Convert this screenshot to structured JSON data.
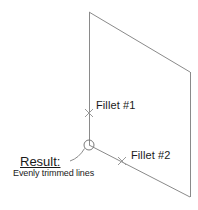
{
  "diagram": {
    "stroke_color": "#8a8a8a",
    "marker_color": "#8a8a8a",
    "text_color": "#1a1a1a",
    "background": "#ffffff",
    "annotations": {
      "fillet_1": "Fillet #1",
      "fillet_2": "Fillet #2",
      "result_title": "Result:",
      "result_description": "Evenly trimmed lines"
    },
    "geometry": {
      "shape": "parallelogram",
      "vertices": [
        {
          "name": "top-left",
          "x": 89,
          "y": 12
        },
        {
          "name": "top-right",
          "x": 190,
          "y": 72
        },
        {
          "name": "bottom-right",
          "x": 190,
          "y": 197
        },
        {
          "name": "bottom-left-vertex",
          "x": 89,
          "y": 145
        }
      ],
      "vertex_marker": {
        "name": "corner-circle",
        "x": 89,
        "y": 145,
        "r": 5
      },
      "fillet_markers": [
        {
          "name": "fillet-1-marker",
          "x": 89,
          "y": 113
        },
        {
          "name": "fillet-2-marker",
          "x": 122,
          "y": 161
        }
      ],
      "leader": {
        "from_x": 72,
        "from_y": 159,
        "to_x": 85,
        "to_y": 148
      }
    }
  }
}
